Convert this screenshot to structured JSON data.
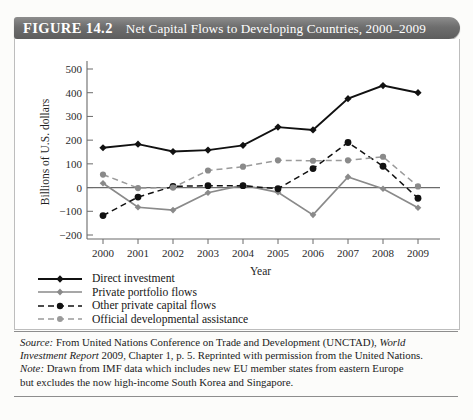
{
  "figure": {
    "number_label": "FIGURE 14.2",
    "title": "Net Capital Flows to Developing Countries, 2000–2009"
  },
  "axes": {
    "ylabel": "Billions of U.S. dollars",
    "xlabel": "Year",
    "yticks": [
      "500",
      "400",
      "300",
      "200",
      "100",
      "0",
      "−100",
      "−200"
    ],
    "xticks": [
      "2000",
      "2001",
      "2002",
      "2003",
      "2004",
      "2005",
      "2006",
      "2007",
      "2008",
      "2009"
    ]
  },
  "legend": {
    "items": [
      {
        "label": "Direct investment",
        "color": "#111111",
        "style": "solid",
        "marker": "diamond"
      },
      {
        "label": "Private portfolio flows",
        "color": "#8a8a8a",
        "style": "solid",
        "marker": "diamond"
      },
      {
        "label": "Other private capital flows",
        "color": "#111111",
        "style": "dashed",
        "marker": "circle"
      },
      {
        "label": "Official developmental assistance",
        "color": "#9a9a9a",
        "style": "dashed",
        "marker": "circle"
      }
    ]
  },
  "caption": {
    "source_label": "Source:",
    "source_line1": " From United Nations Conference on Trade and Development (UNCTAD), ",
    "source_italic": "World",
    "source_line2": "Investment Report",
    "source_line2b": " 2009, Chapter 1, p. 5. Reprinted with permission from the United Nations.",
    "note_label": "Note:",
    "note_line1": " Drawn from IMF data which includes new EU member states from eastern Europe",
    "note_line2": "but excludes the now high-income South Korea and Singapore."
  },
  "chart_data": {
    "type": "line",
    "title": "Net Capital Flows to Developing Countries, 2000–2009",
    "xlabel": "Year",
    "ylabel": "Billions of U.S. dollars",
    "x": [
      2000,
      2001,
      2002,
      2003,
      2004,
      2005,
      2006,
      2007,
      2008,
      2009
    ],
    "ylim": [
      -200,
      500
    ],
    "xlim": [
      2000,
      2009
    ],
    "ytick_values": [
      500,
      400,
      300,
      200,
      100,
      0,
      -100,
      -200
    ],
    "grid": false,
    "legend_position": "below-plot-left",
    "series": [
      {
        "name": "Direct investment",
        "color": "#111111",
        "style": "solid",
        "marker": "diamond",
        "values": [
          168,
          183,
          152,
          158,
          178,
          255,
          243,
          375,
          430,
          400
        ]
      },
      {
        "name": "Private portfolio flows",
        "color": "#8a8a8a",
        "style": "solid",
        "marker": "diamond",
        "values": [
          18,
          -83,
          -95,
          -22,
          10,
          -20,
          -115,
          45,
          -5,
          -85
        ]
      },
      {
        "name": "Other private capital flows",
        "color": "#111111",
        "style": "dashed",
        "marker": "circle",
        "values": [
          -118,
          -40,
          5,
          8,
          8,
          -5,
          80,
          190,
          90,
          -45
        ]
      },
      {
        "name": "Official developmental assistance",
        "color": "#9a9a9a",
        "style": "dashed",
        "marker": "circle",
        "values": [
          55,
          -2,
          0,
          72,
          88,
          115,
          113,
          115,
          130,
          5
        ]
      }
    ]
  }
}
